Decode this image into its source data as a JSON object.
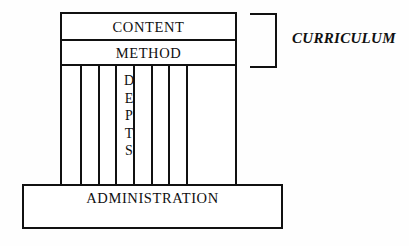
{
  "diagram": {
    "background_color": "#fefefe",
    "line_color": "#111111",
    "fill_color": "#ffffff",
    "top_boxes": [
      {
        "id": "content",
        "label": "CONTENT"
      },
      {
        "id": "method",
        "label": "METHOD"
      }
    ],
    "pillars": {
      "count": 8,
      "label_letters": [
        "D",
        "E",
        "P",
        "T",
        "S"
      ],
      "label_text": "DEPTS",
      "label_pillar_index": 3,
      "divider_positions": [
        18,
        36,
        53,
        71,
        89,
        106,
        124
      ]
    },
    "base": {
      "id": "administration",
      "label": "ADMINISTRATION"
    },
    "bracket_annotation": {
      "label": "CURRICULUM",
      "bracket_shape": "right-square-bracket",
      "spans": [
        "CONTENT",
        "METHOD"
      ]
    }
  }
}
